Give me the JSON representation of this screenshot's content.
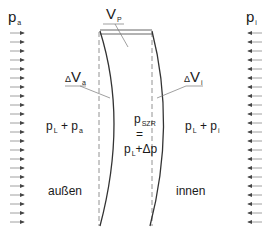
{
  "diagram": {
    "type": "pressure-wall-cross-section",
    "labels": {
      "p_outer": {
        "base": "p",
        "sub": "a"
      },
      "p_inner": {
        "base": "p",
        "sub": "i"
      },
      "volume_p": {
        "base": "V",
        "sub": "P"
      },
      "delta_v_outer": {
        "delta": "Δ",
        "base": "V",
        "sub": "a"
      },
      "delta_v_inner": {
        "delta": "Δ",
        "base": "V",
        "sub": "i"
      },
      "outer_sum": {
        "a": "p",
        "a_sub": "L",
        "op": "+",
        "b": "p",
        "b_sub": "a"
      },
      "inner_sum": {
        "a": "p",
        "a_sub": "L",
        "op": "+",
        "b": "p",
        "b_sub": "i"
      },
      "wall_pressure": {
        "base": "p",
        "sub": "SZR",
        "eq": "=",
        "rhs_base": "p",
        "rhs_sub": "L",
        "rhs_op": "+Δp"
      },
      "outside": "außen",
      "inside": "innen"
    },
    "arrows": {
      "left_count": 20,
      "right_count": 20,
      "left_direction": "right",
      "right_direction": "left"
    },
    "colors": {
      "line": "#333333",
      "dashed": "#777777",
      "arrow": "#444444"
    }
  }
}
